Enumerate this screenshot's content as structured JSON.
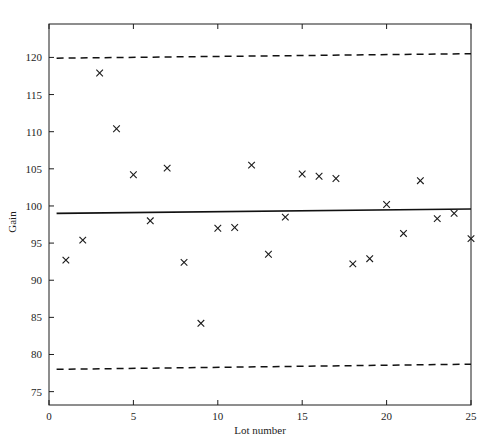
{
  "chart_data": {
    "type": "scatter",
    "title": "",
    "xlabel": "Lot number",
    "ylabel": "Gain",
    "xlim": [
      0,
      25
    ],
    "ylim": [
      73.2,
      124.5
    ],
    "xticks": [
      0,
      5,
      10,
      15,
      20,
      25
    ],
    "yticks": [
      75,
      80,
      85,
      90,
      95,
      100,
      105,
      110,
      115,
      120
    ],
    "grid": false,
    "legend": null,
    "marker": "x",
    "series": [
      {
        "name": "Gain",
        "x": [
          1,
          2,
          3,
          4,
          5,
          6,
          7,
          8,
          9,
          10,
          11,
          12,
          13,
          14,
          15,
          16,
          17,
          18,
          19,
          20,
          21,
          22,
          23,
          24,
          25
        ],
        "values": [
          92.7,
          95.4,
          117.9,
          110.4,
          104.2,
          98.0,
          105.1,
          92.4,
          84.2,
          97.0,
          97.1,
          105.5,
          93.5,
          98.5,
          104.3,
          104.0,
          103.7,
          92.2,
          92.9,
          100.2,
          96.3,
          103.4,
          98.3,
          99.0,
          95.6
        ]
      }
    ],
    "reference_lines": [
      {
        "name": "center-line",
        "style": "solid",
        "x": [
          0.45,
          25.0
        ],
        "y": [
          99.0,
          99.6
        ]
      },
      {
        "name": "upper-control-limit",
        "style": "dashed",
        "x": [
          0.45,
          25.0
        ],
        "y": [
          119.9,
          120.5
        ]
      },
      {
        "name": "lower-control-limit",
        "style": "dashed",
        "x": [
          0.45,
          25.0
        ],
        "y": [
          78.0,
          78.7
        ]
      }
    ]
  },
  "axes": {
    "x_tick_labels": [
      "0",
      "5",
      "10",
      "15",
      "20",
      "25"
    ],
    "y_tick_labels": [
      "75",
      "80",
      "85",
      "90",
      "95",
      "100",
      "105",
      "110",
      "115",
      "120"
    ],
    "x_axis_title": "Lot number",
    "y_axis_title": "Gain"
  }
}
